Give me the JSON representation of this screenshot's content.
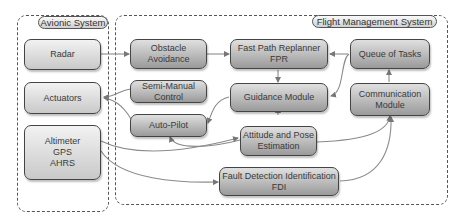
{
  "diagram": {
    "groups": {
      "avionic": {
        "label": "Avionic System"
      },
      "fms": {
        "label": "Flight Management System"
      }
    },
    "avionic_nodes": {
      "radar": {
        "lines": [
          "Radar"
        ]
      },
      "actuators": {
        "lines": [
          "Actuators"
        ]
      },
      "sensors": {
        "lines": [
          "Altimeter",
          "GPS",
          "AHRS"
        ]
      }
    },
    "fms_nodes": {
      "obstacle_avoidance": {
        "lines": [
          "Obstacle",
          "Avoidance"
        ]
      },
      "semi_manual_control": {
        "lines": [
          "Semi-Manual",
          "Control"
        ]
      },
      "auto_pilot": {
        "lines": [
          "Auto-Pilot"
        ]
      },
      "fpr": {
        "lines": [
          "Fast Path Replanner",
          "FPR"
        ]
      },
      "guidance_module": {
        "lines": [
          "Guidance Module"
        ]
      },
      "attitude_pose": {
        "lines": [
          "Attitude and Pose",
          "Estimation"
        ]
      },
      "fdi": {
        "lines": [
          "Fault Detection Identification",
          "FDI"
        ]
      },
      "queue_of_tasks": {
        "lines": [
          "Queue of Tasks"
        ]
      },
      "communication_module": {
        "lines": [
          "Communication",
          "Module"
        ]
      }
    },
    "edges": [
      {
        "from": "Radar",
        "to": "Obstacle Avoidance"
      },
      {
        "from": "Obstacle Avoidance",
        "to": "Fast Path Replanner FPR"
      },
      {
        "from": "Fast Path Replanner FPR",
        "to": "Guidance Module"
      },
      {
        "from": "Queue of Tasks",
        "to": "Fast Path Replanner FPR"
      },
      {
        "from": "Queue of Tasks",
        "to": "Guidance Module"
      },
      {
        "from": "Communication Module",
        "to": "Queue of Tasks"
      },
      {
        "from": "Guidance Module",
        "to": "Auto-Pilot"
      },
      {
        "from": "Semi-Manual Control",
        "to": "Actuators"
      },
      {
        "from": "Auto-Pilot",
        "to": "Actuators"
      },
      {
        "from": "Attitude and Pose Estimation",
        "to": "Guidance Module"
      },
      {
        "from": "Attitude and Pose Estimation",
        "to": "Auto-Pilot"
      },
      {
        "from": "Altimeter GPS AHRS",
        "to": "Attitude and Pose Estimation"
      },
      {
        "from": "Altimeter GPS AHRS",
        "to": "Fault Detection Identification FDI"
      },
      {
        "from": "Attitude and Pose Estimation",
        "to": "Communication Module"
      },
      {
        "from": "Fault Detection Identification FDI",
        "to": "Communication Module"
      }
    ]
  }
}
